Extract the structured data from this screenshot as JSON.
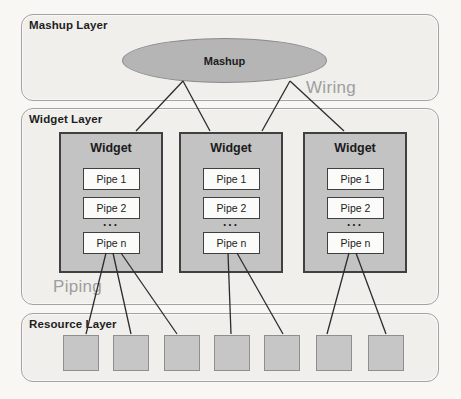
{
  "diagram": {
    "layers": [
      {
        "id": "mashup",
        "label": "Mashup Layer"
      },
      {
        "id": "widget",
        "label": "Widget Layer"
      },
      {
        "id": "resource",
        "label": "Resource Layer"
      }
    ],
    "mashup_node": {
      "label": "Mashup"
    },
    "annotations": {
      "wiring": "Wiring",
      "piping": "Piping"
    },
    "widgets": [
      {
        "label": "Widget",
        "pipes": {
          "pipe1": "Pipe 1",
          "pipe2": "Pipe 2",
          "ellipsis": "...",
          "pipe_n": "Pipe n"
        }
      },
      {
        "label": "Widget",
        "pipes": {
          "pipe1": "Pipe 1",
          "pipe2": "Pipe 2",
          "ellipsis": "...",
          "pipe_n": "Pipe n"
        }
      },
      {
        "label": "Widget",
        "pipes": {
          "pipe1": "Pipe 1",
          "pipe2": "Pipe 2",
          "ellipsis": "...",
          "pipe_n": "Pipe n"
        }
      }
    ],
    "resources": {
      "count": 7
    },
    "connections": {
      "wiring": [
        {
          "from": "mashup",
          "to": "widget-1"
        },
        {
          "from": "mashup",
          "to": "widget-2"
        },
        {
          "from": "mashup",
          "to": "widget-2"
        },
        {
          "from": "mashup",
          "to": "widget-3"
        }
      ],
      "piping": [
        {
          "from": "widget-1-pipe-n",
          "to": "resource-1"
        },
        {
          "from": "widget-1-pipe-n",
          "to": "resource-2"
        },
        {
          "from": "widget-1-pipe-n",
          "to": "resource-3"
        },
        {
          "from": "widget-2-pipe-n",
          "to": "resource-4"
        },
        {
          "from": "widget-2-pipe-n",
          "to": "resource-5"
        },
        {
          "from": "widget-3-pipe-n",
          "to": "resource-6"
        },
        {
          "from": "widget-3-pipe-n",
          "to": "resource-7"
        }
      ]
    },
    "colors": {
      "page_background": "#f8f7f4",
      "layer_fill": "#f0efec",
      "layer_border": "#a3a3a3",
      "mashup_node_fill": "#b5b5b5",
      "mashup_node_border": "#8a8a8a",
      "widget_fill": "#c3c3c3",
      "widget_border": "#404040",
      "pipe_fill": "#fbfbfa",
      "resource_fill": "#c6c6c6",
      "resource_border": "#8f8f8f",
      "annotation_text": "#9e9e9e",
      "label_text": "#1e1e1e",
      "connector_line": "#2c2c2c"
    }
  }
}
